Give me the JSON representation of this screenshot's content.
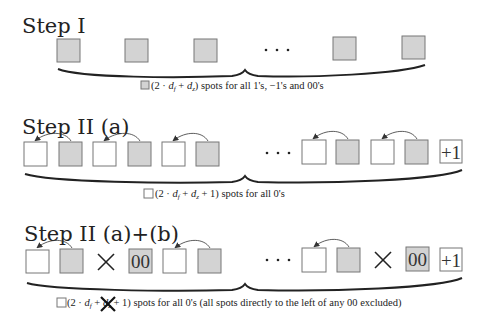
{
  "steps": [
    {
      "title": "Step I",
      "label": {
        "prefix": "(2 · ",
        "var1": "d",
        "sub1": "f",
        "mid": " + ",
        "var2": "d",
        "sub2": "z",
        "suffix": ") spots for all 1's, −1's and 00's",
        "legend_box": "grey"
      }
    },
    {
      "title": "Step II (a)",
      "label": {
        "prefix": "(2 · ",
        "var1": "d",
        "sub1": "f",
        "mid": " + ",
        "var2": "d",
        "sub2": "z",
        "suffix": " + 1) spots for all 0's",
        "legend_box": "white"
      },
      "end_box": "+1"
    },
    {
      "title": "Step II (a)+(b)",
      "label": {
        "prefix": "(2 · ",
        "var1": "d",
        "sub1": "f",
        "mid": " + ",
        "var2": "d",
        "sub2": "z",
        "suffix": " + 1) spots for all 0's (all spots directly to the left of any 00 excluded)",
        "legend_box": "white",
        "crossed_out": "+ dz"
      },
      "marked_box": "00",
      "end_box": "+1",
      "exclusion_mark": "×"
    }
  ],
  "ellipsis": "···",
  "colors": {
    "grey_box": "#d3d3d3",
    "box_border": "#777777",
    "text": "#222222"
  }
}
